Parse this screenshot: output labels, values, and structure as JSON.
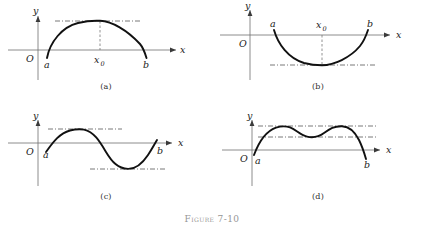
{
  "figure": {
    "caption": "Figure 7-10",
    "background_color": "#ffffff",
    "curve_color": "#111111",
    "axis_color": "#6e6e6e",
    "helper_line_color": "#555555"
  },
  "axis_labels": {
    "x": "x",
    "y": "y",
    "origin": "O",
    "left_endpoint": "a",
    "right_endpoint": "b",
    "critical_point": "x",
    "critical_point_subscript": "0"
  },
  "panels": [
    {
      "id": "a",
      "caption": "(a)",
      "description": "single interior maximum on closed interval",
      "extremum_type": "maximum",
      "has_critical_point_label": true,
      "helper_levels": 1
    },
    {
      "id": "b",
      "caption": "(b)",
      "description": "single interior minimum on closed interval",
      "extremum_type": "minimum",
      "has_critical_point_label": true,
      "helper_levels": 1
    },
    {
      "id": "c",
      "caption": "(c)",
      "description": "one interior maximum and one interior minimum",
      "extremum_type": "maximum-and-minimum",
      "has_critical_point_label": false,
      "helper_levels": 2
    },
    {
      "id": "d",
      "caption": "(d)",
      "description": "two equal interior maxima with a local minimum between",
      "extremum_type": "two-maxima-one-minimum",
      "has_critical_point_label": false,
      "helper_levels": 2
    }
  ]
}
